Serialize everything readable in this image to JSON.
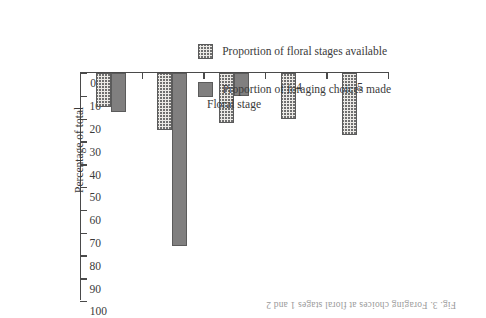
{
  "figure": {
    "caption_fragment": "Fig. 3. Foraging choices at floral stages 1 and 2",
    "orientation_note": "rotated-180"
  },
  "chart_data": {
    "type": "bar",
    "title": "",
    "xlabel": "Floral stage",
    "ylabel": "Percentage of total",
    "categories": [
      "1",
      "2",
      "3",
      "4",
      "5"
    ],
    "series": [
      {
        "name": "Proportion of foraging choices made",
        "pattern": "solid",
        "color": "#807f7f",
        "values": [
          17,
          76,
          10,
          0,
          0
        ]
      },
      {
        "name": "Proportion of floral stages available",
        "pattern": "dotted",
        "color": "#eceae6",
        "values": [
          15,
          25,
          22,
          20,
          27
        ]
      }
    ],
    "ylim": [
      0,
      100
    ],
    "yticks": [
      0,
      10,
      20,
      30,
      40,
      50,
      60,
      70,
      80,
      90,
      100
    ],
    "ytick_labels": [
      "0",
      "10",
      "20",
      "30",
      "40",
      "50",
      "60",
      "70",
      "80",
      "90",
      "100"
    ],
    "grid": false,
    "legend_position": "lower-left"
  },
  "legend": {
    "entries": [
      {
        "label": "Proportion of foraging choices made",
        "pattern": "solid"
      },
      {
        "label": "Proportion of floral stages available",
        "pattern": "dotted"
      }
    ]
  }
}
